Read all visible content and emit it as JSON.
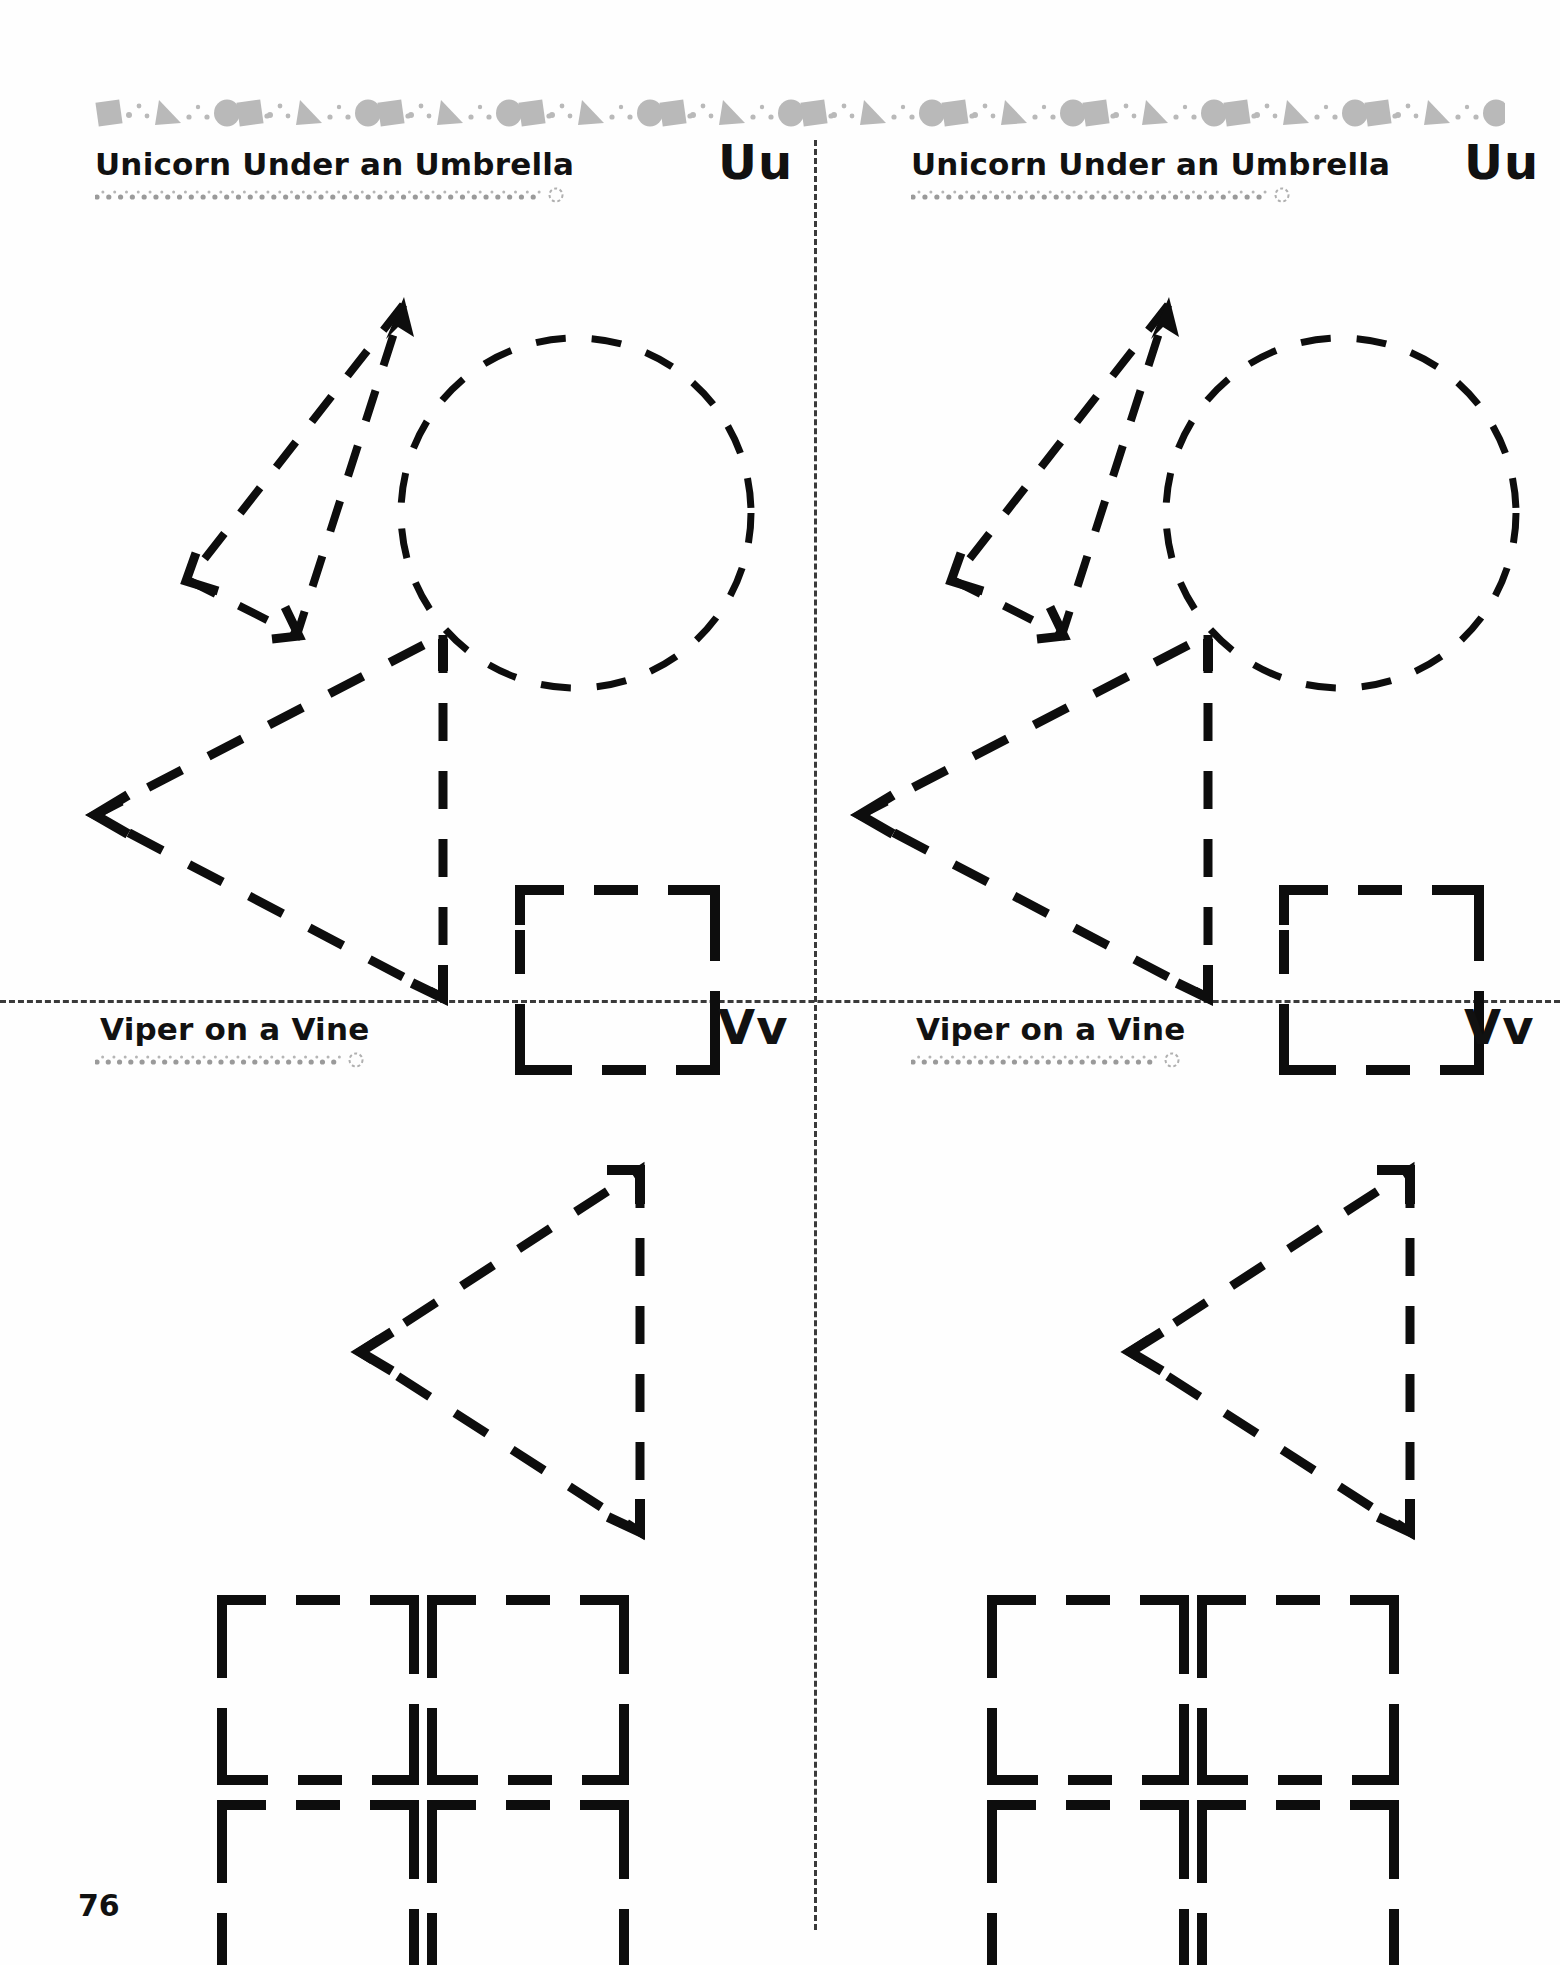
{
  "page": {
    "number": "76",
    "background_color": "#fefefe",
    "ink_color": "#0d0d0d",
    "border_shape_color": "#b9b9b9"
  },
  "top_border": {
    "name": "decorative-shape-border",
    "pattern": [
      "square",
      "dot",
      "dot",
      "triangle",
      "dot",
      "dot",
      "circle",
      "dot",
      "dot"
    ],
    "repeat_count": 10,
    "color": "#b9b9b9"
  },
  "dividers": {
    "vertical_label": "vertical-dashed-divider",
    "horizontal_label": "horizontal-dashed-divider",
    "color": "#3a3a3a"
  },
  "panels": [
    {
      "id": "panel-uu-left",
      "title": "Unicorn Under an Umbrella",
      "letter": "Uu",
      "underline_dots": 38,
      "shapes": [
        "unicorn-horn-triangle",
        "arrow-tip",
        "dashed-circle",
        "left-pointing-triangle",
        "dashed-square"
      ]
    },
    {
      "id": "panel-uu-right",
      "title": "Unicorn Under an Umbrella",
      "letter": "Uu",
      "underline_dots": 30,
      "shapes": [
        "unicorn-horn-triangle",
        "arrow-tip",
        "dashed-circle",
        "left-pointing-triangle",
        "dashed-square"
      ]
    },
    {
      "id": "panel-vv-left",
      "title": "Viper on a Vine",
      "letter": "Vv",
      "underline_dots": 22,
      "shapes": [
        "left-pointing-triangle",
        "dashed-square",
        "dashed-square",
        "dashed-square",
        "dashed-square"
      ]
    },
    {
      "id": "panel-vv-right",
      "title": "Viper on a Vine",
      "letter": "Vv",
      "underline_dots": 22,
      "shapes": [
        "left-pointing-triangle",
        "dashed-square",
        "dashed-square",
        "dashed-square",
        "dashed-square"
      ]
    }
  ]
}
